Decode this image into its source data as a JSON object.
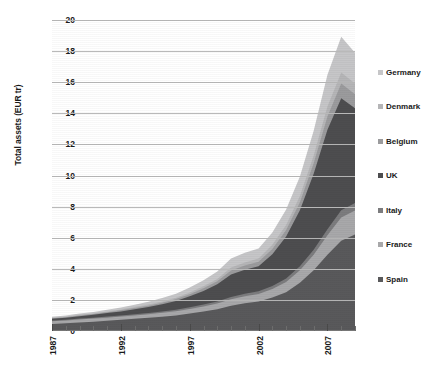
{
  "chart_data": {
    "type": "area",
    "stacked": true,
    "title": "",
    "xlabel": "",
    "ylabel": "Total assets (EUR tr)",
    "ylim": [
      0,
      20
    ],
    "ytick_labels": [
      "0",
      "2",
      "4",
      "6",
      "8",
      "10",
      "12",
      "14",
      "16",
      "18",
      "20"
    ],
    "ytick_values": [
      0,
      2,
      4,
      6,
      8,
      10,
      12,
      14,
      16,
      18,
      20
    ],
    "grid": true,
    "grid_axis": "y",
    "legend_position": "right",
    "xtick_labels": [
      "1987",
      "1992",
      "1997",
      "2002",
      "2007"
    ],
    "xtick_values": [
      1987,
      1992,
      1997,
      2002,
      2007
    ],
    "x": [
      1987,
      1988,
      1989,
      1990,
      1991,
      1992,
      1993,
      1994,
      1995,
      1996,
      1997,
      1998,
      1999,
      2000,
      2001,
      2002,
      2003,
      2004,
      2005,
      2006,
      2007,
      2008,
      2009
    ],
    "stack_order_bottom_to_top": [
      "Spain",
      "France",
      "Italy",
      "UK",
      "Belgium",
      "Denmark",
      "Germany"
    ],
    "series": [
      {
        "name": "Spain",
        "color": "#59595b",
        "values": [
          0.45,
          0.5,
          0.55,
          0.6,
          0.66,
          0.72,
          0.78,
          0.85,
          0.92,
          1.0,
          1.12,
          1.25,
          1.4,
          1.62,
          1.78,
          1.9,
          2.15,
          2.5,
          3.1,
          3.9,
          4.9,
          5.8,
          6.2
        ]
      },
      {
        "name": "France",
        "color": "#a8a8aa",
        "values": [
          0.18,
          0.18,
          0.19,
          0.2,
          0.2,
          0.21,
          0.22,
          0.23,
          0.25,
          0.27,
          0.3,
          0.33,
          0.37,
          0.42,
          0.45,
          0.48,
          0.55,
          0.65,
          0.8,
          1.0,
          1.25,
          1.5,
          1.55
        ]
      },
      {
        "name": "Italy",
        "color": "#7c7c7e",
        "values": [
          0.05,
          0.05,
          0.06,
          0.06,
          0.07,
          0.07,
          0.08,
          0.08,
          0.09,
          0.1,
          0.11,
          0.12,
          0.13,
          0.15,
          0.16,
          0.17,
          0.19,
          0.22,
          0.26,
          0.32,
          0.4,
          0.46,
          0.48
        ]
      },
      {
        "name": "UK",
        "color": "#4d4d4f",
        "values": [
          0.1,
          0.12,
          0.15,
          0.18,
          0.22,
          0.26,
          0.32,
          0.38,
          0.46,
          0.56,
          0.7,
          0.88,
          1.1,
          1.45,
          1.55,
          1.62,
          2.05,
          2.7,
          3.6,
          4.9,
          6.4,
          7.2,
          6.1
        ]
      },
      {
        "name": "Belgium",
        "color": "#9b9b9d",
        "values": [
          0.04,
          0.04,
          0.05,
          0.05,
          0.06,
          0.07,
          0.08,
          0.09,
          0.1,
          0.12,
          0.14,
          0.17,
          0.2,
          0.25,
          0.27,
          0.28,
          0.34,
          0.42,
          0.52,
          0.66,
          0.84,
          0.95,
          0.9
        ]
      },
      {
        "name": "Denmark",
        "color": "#b5b5b7",
        "values": [
          0.03,
          0.03,
          0.04,
          0.04,
          0.05,
          0.05,
          0.06,
          0.07,
          0.08,
          0.09,
          0.11,
          0.13,
          0.15,
          0.19,
          0.2,
          0.21,
          0.26,
          0.32,
          0.4,
          0.5,
          0.64,
          0.72,
          0.68
        ]
      },
      {
        "name": "Germany",
        "color": "#c6c6c8",
        "values": [
          0.06,
          0.07,
          0.08,
          0.09,
          0.11,
          0.13,
          0.15,
          0.18,
          0.22,
          0.26,
          0.32,
          0.39,
          0.47,
          0.59,
          0.62,
          0.65,
          0.8,
          1.0,
          1.25,
          1.6,
          2.05,
          2.3,
          1.98
        ]
      }
    ],
    "totals": [
      0.91,
      0.99,
      1.12,
      1.22,
      1.37,
      1.51,
      1.69,
      1.88,
      2.12,
      2.4,
      2.8,
      3.27,
      3.82,
      4.67,
      5.03,
      5.31,
      6.34,
      7.81,
      9.93,
      12.88,
      16.48,
      18.93,
      17.89
    ]
  },
  "legend": {
    "items": [
      {
        "label": "Germany",
        "swatch": "legend-swatch-germany"
      },
      {
        "label": "Denmark",
        "swatch": "legend-swatch-denmark"
      },
      {
        "label": "Belgium",
        "swatch": "legend-swatch-belgium"
      },
      {
        "label": "UK",
        "swatch": "legend-swatch-uk"
      },
      {
        "label": "Italy",
        "swatch": "legend-swatch-italy"
      },
      {
        "label": "France",
        "swatch": "legend-swatch-france"
      },
      {
        "label": "Spain",
        "swatch": "legend-swatch-spain"
      }
    ]
  }
}
